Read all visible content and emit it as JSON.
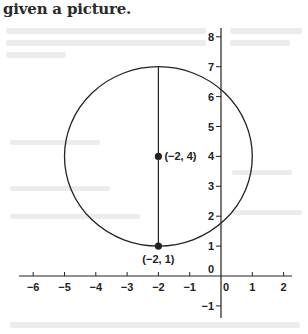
{
  "caption": "given a picture.",
  "chart_data": {
    "type": "diagram",
    "title": "",
    "x_axis": {
      "ticks": [
        -6,
        -5,
        -4,
        -3,
        -2,
        -1,
        0,
        1,
        2
      ],
      "tick_labels": [
        "−6",
        "−5",
        "−4",
        "−3",
        "−2",
        "−1",
        "0",
        "1",
        "2"
      ],
      "range": [
        -6.5,
        2.3
      ]
    },
    "y_axis": {
      "ticks": [
        -1,
        0,
        1,
        2,
        3,
        4,
        5,
        6,
        7,
        8
      ],
      "tick_labels": [
        "−1",
        "0",
        "1",
        "2",
        "3",
        "4",
        "5",
        "6",
        "7",
        "8"
      ],
      "range": [
        -1.4,
        8.3
      ]
    },
    "grid": false,
    "circle": {
      "center": [
        -2,
        4
      ],
      "radius": 3
    },
    "segment": {
      "from": [
        -2,
        1
      ],
      "to": [
        -2,
        7
      ]
    },
    "points": [
      {
        "x": -2,
        "y": 4,
        "label": "(−2, 4)"
      },
      {
        "x": -2,
        "y": 1,
        "label": "(−2, 1)"
      }
    ]
  },
  "colors": {
    "ink": "#222222",
    "background": "#ffffff"
  }
}
